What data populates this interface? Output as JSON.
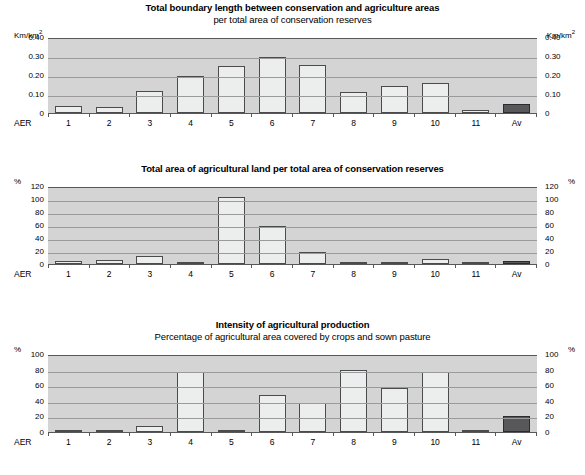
{
  "figure": {
    "categories_label": "AER",
    "categories": [
      "1",
      "2",
      "3",
      "4",
      "5",
      "6",
      "7",
      "8",
      "9",
      "10",
      "11",
      "Av"
    ],
    "colors": {
      "plot_background": "#d4d4d4",
      "gridline": "#9a9a9c",
      "bar_fill": "#eceded",
      "bar_outline": "#4b4b4d",
      "average_bar_fill": "#58585a",
      "text": "#000000"
    }
  },
  "chart_data": [
    {
      "type": "bar",
      "title": "Total boundary length between conservation and agriculture areas",
      "subtitle": "per total area of conservation reserves",
      "unit_left": "Km/km",
      "unit_left_sup": "2",
      "unit_right": "Km/km",
      "unit_right_sup": "2",
      "xlabel": "AER",
      "ylabel": "Km/km2",
      "categories": [
        "1",
        "2",
        "3",
        "4",
        "5",
        "6",
        "7",
        "8",
        "9",
        "10",
        "11",
        "Av"
      ],
      "values": [
        0.035,
        0.034,
        0.115,
        0.193,
        0.246,
        0.293,
        0.255,
        0.112,
        0.141,
        0.16,
        0.018,
        0.046
      ],
      "ticks": [
        "0.40",
        "0.30",
        "0.20",
        "0.10",
        "0"
      ],
      "tick_values": [
        0.4,
        0.3,
        0.2,
        0.1,
        0
      ],
      "ylim": [
        0,
        0.4
      ],
      "grid": true,
      "legend": "none",
      "average_category": "Av"
    },
    {
      "type": "bar",
      "title": "Total area of agricultural land per total area of conservation reserves",
      "subtitle": "",
      "unit_left": "%",
      "unit_left_sup": "",
      "unit_right": "%",
      "unit_right_sup": "",
      "xlabel": "AER",
      "ylabel": "%",
      "categories": [
        "1",
        "2",
        "3",
        "4",
        "5",
        "6",
        "7",
        "8",
        "9",
        "10",
        "11",
        "Av"
      ],
      "values": [
        5,
        6,
        13,
        2,
        103,
        58,
        19,
        3,
        3,
        8,
        3,
        5
      ],
      "ticks": [
        "120",
        "100",
        "80",
        "60",
        "40",
        "20",
        "0"
      ],
      "tick_values": [
        120,
        100,
        80,
        60,
        40,
        20,
        0
      ],
      "ylim": [
        0,
        120
      ],
      "grid": true,
      "legend": "none",
      "average_category": "Av"
    },
    {
      "type": "bar",
      "title": "Intensity of agricultural production",
      "subtitle": "Percentage of agricultural area covered by crops and sown pasture",
      "unit_left": "%",
      "unit_left_sup": "",
      "unit_right": "%",
      "unit_right_sup": "",
      "xlabel": "AER",
      "ylabel": "%",
      "categories": [
        "1",
        "2",
        "3",
        "4",
        "5",
        "6",
        "7",
        "8",
        "9",
        "10",
        "11",
        "Av"
      ],
      "values": [
        1,
        1,
        8,
        77,
        3,
        47,
        37,
        80,
        56,
        77,
        1,
        20
      ],
      "ticks": [
        "100",
        "80",
        "60",
        "40",
        "20",
        "0"
      ],
      "tick_values": [
        100,
        80,
        60,
        40,
        20,
        0
      ],
      "ylim": [
        0,
        100
      ],
      "grid": true,
      "legend": "none",
      "average_category": "Av"
    }
  ]
}
